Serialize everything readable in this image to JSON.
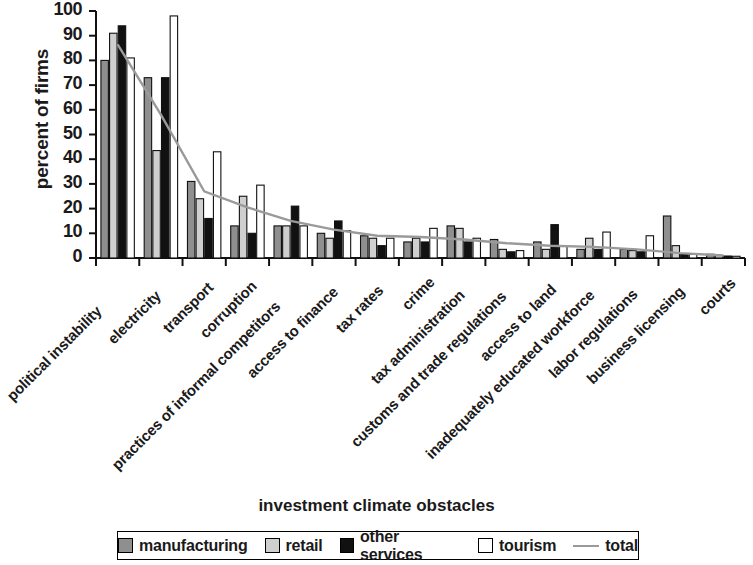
{
  "chart_data": {
    "type": "bar",
    "title": "",
    "xlabel": "investment climate obstacles",
    "ylabel": "percent of firms",
    "ylim": [
      0,
      100
    ],
    "yticks": [
      0,
      10,
      20,
      30,
      40,
      50,
      60,
      70,
      80,
      90,
      100
    ],
    "grid": false,
    "legend_position": "bottom",
    "categories": [
      "political instability",
      "electricity",
      "transport",
      "corruption",
      "practices of informal competitors",
      "access to finance",
      "tax rates",
      "crime",
      "tax administration",
      "customs and trade regulations",
      "access to land",
      "inadequately educated workforce",
      "labor regulations",
      "business licensing",
      "courts"
    ],
    "series": [
      {
        "name": "manufacturing",
        "color": "#8f8f8f",
        "values": [
          80,
          73,
          31,
          13,
          13,
          10,
          9,
          6.5,
          13,
          7.5,
          6.5,
          3.5,
          3.5,
          17,
          1.5
        ]
      },
      {
        "name": "retail",
        "color": "#cfcfcf",
        "values": [
          91,
          43.5,
          24,
          25,
          13,
          8,
          8,
          8,
          12,
          3.5,
          3.5,
          8,
          3,
          5,
          1
        ]
      },
      {
        "name": "other services",
        "color": "#111111",
        "values": [
          94,
          73,
          16,
          10,
          21,
          15,
          5,
          6.5,
          6.5,
          2.5,
          13.5,
          3.5,
          2.5,
          1.5,
          0.8
        ]
      },
      {
        "name": "tourism",
        "color": "#ffffff",
        "values": [
          81,
          98,
          43,
          29.5,
          13,
          11,
          8,
          12,
          8,
          3,
          5,
          10.5,
          9,
          1.5,
          0.7
        ]
      }
    ],
    "line_series": {
      "name": "total",
      "color": "#9a9a9a",
      "values": [
        86.5,
        58,
        27,
        20.5,
        15,
        11.5,
        9,
        8.5,
        7.5,
        6,
        5,
        4.5,
        3.5,
        2,
        1
      ]
    }
  },
  "legend": {
    "items": [
      {
        "label": "manufacturing",
        "kind": "swatch",
        "color": "#8f8f8f"
      },
      {
        "label": "retail",
        "kind": "swatch",
        "color": "#cfcfcf"
      },
      {
        "label": "other services",
        "kind": "swatch",
        "color": "#111111"
      },
      {
        "label": "tourism",
        "kind": "swatch",
        "color": "#ffffff"
      },
      {
        "label": "total",
        "kind": "line",
        "color": "#9a9a9a"
      }
    ]
  }
}
